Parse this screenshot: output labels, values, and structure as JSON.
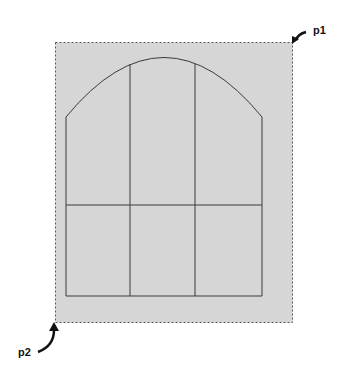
{
  "diagram": {
    "type": "arched-window-selection",
    "colors": {
      "background": "#ffffff",
      "selection_fill": "#d6d6d6",
      "selection_border": "#555555",
      "window_line": "#3a3a3a",
      "arrow": "#111111"
    },
    "selection_rect": {
      "x1": 55,
      "y1": 42,
      "x2": 292,
      "y2": 322
    },
    "window": {
      "left": 66,
      "right": 262,
      "spring_y": 117,
      "crown_y": 57,
      "bottom": 296,
      "transom_y": 205,
      "mullions_x": [
        130,
        195
      ]
    },
    "labels": {
      "p1": "p1",
      "p2": "p2"
    }
  }
}
